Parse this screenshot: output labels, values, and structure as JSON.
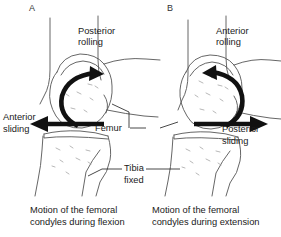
{
  "figure": {
    "title": "Motion of the femoral condyles",
    "background": "#ffffff",
    "ink": "#1a1a1a",
    "bone_outline": "#555555",
    "arrow_color": "#111111"
  },
  "panels": [
    {
      "letter": "A",
      "caption_line1": "Motion of the femoral",
      "caption_line2": "condyles during flexion",
      "labels": {
        "rolling_line1": "Posterior",
        "rolling_line2": "rolling",
        "sliding_line1": "Anterior",
        "sliding_line2": "sliding",
        "femur": "Femur",
        "tibia_line1": "Tibia",
        "tibia_line2": "fixed"
      },
      "motions": {
        "rolling_direction": "posterior",
        "sliding_direction": "anterior",
        "rotation": "counter-clockwise-curved-arrow",
        "tibia_state": "fixed"
      }
    },
    {
      "letter": "B",
      "caption_line1": "Motion of the femoral",
      "caption_line2": "condyles during extension",
      "labels": {
        "rolling_line1": "Anterior",
        "rolling_line2": "rolling",
        "sliding_line1": "Posterior",
        "sliding_line2": "sliding"
      },
      "motions": {
        "rolling_direction": "anterior",
        "sliding_direction": "posterior",
        "rotation": "clockwise-curved-arrow",
        "tibia_state": "fixed"
      }
    }
  ]
}
